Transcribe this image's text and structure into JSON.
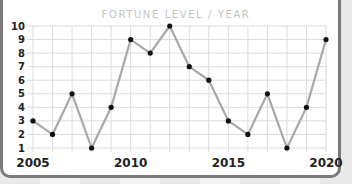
{
  "chart_data": {
    "type": "line",
    "title": "FORTUNE LEVEL / YEAR",
    "xlabel": "",
    "ylabel": "",
    "x": [
      2005,
      2006,
      2007,
      2008,
      2009,
      2010,
      2011,
      2012,
      2013,
      2014,
      2015,
      2016,
      2017,
      2018,
      2019,
      2020
    ],
    "values": [
      3,
      2,
      5,
      1,
      4,
      9,
      8,
      10,
      7,
      6,
      3,
      2,
      5,
      1,
      4,
      9
    ],
    "xlim": [
      2005,
      2020
    ],
    "ylim": [
      1,
      10
    ],
    "x_tick_labels": [
      "2005",
      "2010",
      "2015",
      "2020"
    ],
    "y_tick_labels": [
      "1",
      "2",
      "3",
      "4",
      "5",
      "6",
      "7",
      "8",
      "9",
      "10"
    ],
    "grid": true,
    "legend": null,
    "colors": {
      "line": "#a8a8a8",
      "marker": "#111111",
      "grid": "#dcdcdc",
      "title": "#c4c4c4"
    }
  }
}
